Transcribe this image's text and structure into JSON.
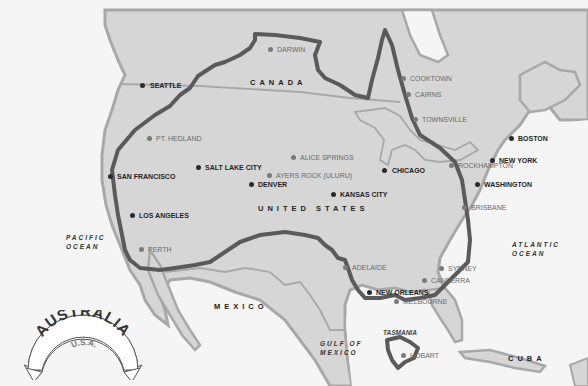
{
  "title_badge": {
    "main": "AUSTRALIA",
    "sub": "U.S.A."
  },
  "colors": {
    "ocean": "#f5f5f5",
    "land": "#d6d6d6",
    "coast": "#a8a8a8",
    "australia_outline": "#5a5a5a",
    "us_city": "#2a2a2a",
    "au_city": "#7a7a7a"
  },
  "countries": [
    {
      "id": "canada",
      "label": "CANADA"
    },
    {
      "id": "united-states",
      "label": "UNITED STATES"
    },
    {
      "id": "mexico",
      "label": "MEXICO"
    },
    {
      "id": "cuba",
      "label": "CUBA"
    }
  ],
  "water_bodies": [
    {
      "id": "pacific",
      "line1": "PACIFIC",
      "line2": "OCEAN"
    },
    {
      "id": "atlantic",
      "line1": "ATLANTIC",
      "line2": "OCEAN"
    },
    {
      "id": "gulf",
      "line1": "GULF OF",
      "line2": "MEXICO"
    }
  ],
  "tasmania_label": "TASMANIA",
  "us_cities": [
    {
      "name": "SEATTLE",
      "x": 142,
      "y": 85
    },
    {
      "name": "SAN FRANCISCO",
      "x": 112,
      "y": 176
    },
    {
      "name": "SALT LAKE CITY",
      "x": 198,
      "y": 167
    },
    {
      "name": "DENVER",
      "x": 252,
      "y": 184
    },
    {
      "name": "LOS ANGELES",
      "x": 132,
      "y": 215
    },
    {
      "name": "KANSAS CITY",
      "x": 334,
      "y": 194
    },
    {
      "name": "CHICAGO",
      "x": 384,
      "y": 170
    },
    {
      "name": "BOSTON",
      "x": 511,
      "y": 138
    },
    {
      "name": "NEW YORK",
      "x": 493,
      "y": 160
    },
    {
      "name": "WASHINGTON",
      "x": 477,
      "y": 184
    },
    {
      "name": "NEW ORLEANS",
      "x": 369,
      "y": 292
    }
  ],
  "au_cities": [
    {
      "name": "DARWIN",
      "x": 270,
      "y": 49
    },
    {
      "name": "COOKTOWN",
      "x": 403,
      "y": 78
    },
    {
      "name": "CAIRNS",
      "x": 408,
      "y": 94
    },
    {
      "name": "TOWNSVILLE",
      "x": 415,
      "y": 119
    },
    {
      "name": "PT. HEDLAND",
      "x": 149,
      "y": 138
    },
    {
      "name": "ALICE SPRINGS",
      "x": 293,
      "y": 157
    },
    {
      "name": "AYERS ROCK (ULURU)",
      "x": 269,
      "y": 175
    },
    {
      "name": "ROCKHAMPTON",
      "x": 451,
      "y": 165
    },
    {
      "name": "BRISBANE",
      "x": 464,
      "y": 207
    },
    {
      "name": "PERTH",
      "x": 141,
      "y": 249
    },
    {
      "name": "ADELAIDE",
      "x": 345,
      "y": 267
    },
    {
      "name": "SYDNEY",
      "x": 441,
      "y": 268
    },
    {
      "name": "CANBERRA",
      "x": 424,
      "y": 280
    },
    {
      "name": "MELBOURNE",
      "x": 396,
      "y": 301
    },
    {
      "name": "HOBART",
      "x": 403,
      "y": 355
    }
  ]
}
